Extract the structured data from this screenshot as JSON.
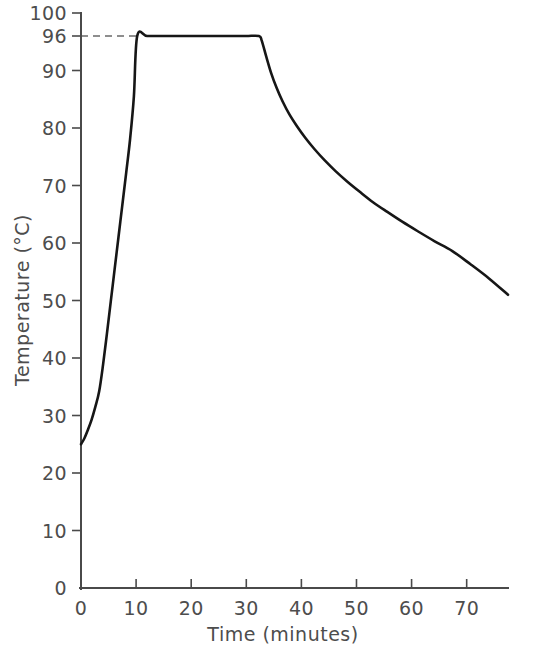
{
  "chart_data": {
    "type": "line",
    "title": "",
    "subtitle": "",
    "xlabel": "Time (minutes)",
    "ylabel": "Temperature (°C)",
    "xlim": [
      0,
      77.5
    ],
    "ylim": [
      0,
      100
    ],
    "grid": false,
    "legend": null,
    "x_ticks": [
      0,
      10,
      20,
      30,
      40,
      50,
      60,
      70
    ],
    "x_tick_labels": [
      "0",
      "10",
      "20",
      "30",
      "40",
      "50",
      "60",
      "70"
    ],
    "y_ticks": [
      0,
      10,
      20,
      30,
      40,
      50,
      60,
      70,
      80,
      90,
      96,
      100
    ],
    "y_tick_labels": [
      "0",
      "10",
      "20",
      "30",
      "40",
      "50",
      "60",
      "70",
      "80",
      "90",
      "96",
      "100"
    ],
    "annotations": [
      {
        "name": "plateau-reference-line",
        "style": "dashed",
        "value": 96,
        "label": "96",
        "from_x": 0,
        "to_x": 10.2,
        "description": "Dashed horizontal reference line marking the 96 °C holding temperature"
      }
    ],
    "series": [
      {
        "name": "Temperature profile",
        "x": [
          0,
          0.6,
          1.2,
          1.9,
          2.6,
          3.3,
          4.0,
          4.7,
          5.4,
          6.1,
          6.8,
          7.5,
          8.2,
          8.9,
          9.6,
          10.2,
          12,
          15,
          18,
          21,
          24,
          27,
          30,
          32.3,
          32.8,
          33.6,
          34.5,
          35.5,
          36.6,
          37.8,
          39.2,
          40.7,
          42.4,
          44.2,
          46.2,
          48.3,
          50.6,
          53.0,
          55.6,
          58.3,
          61.2,
          64.2,
          67.4,
          70.7,
          74.1,
          77.5
        ],
        "y": [
          25.0,
          26.0,
          27.4,
          29.2,
          31.5,
          34.2,
          38.8,
          44.2,
          49.8,
          55.4,
          61.0,
          66.6,
          72.2,
          78.0,
          85.5,
          96.0,
          96.0,
          96.0,
          96.0,
          96.0,
          96.0,
          96.0,
          96.0,
          96.0,
          95.2,
          92.5,
          89.6,
          87.0,
          84.6,
          82.4,
          80.3,
          78.3,
          76.3,
          74.4,
          72.5,
          70.7,
          68.9,
          67.1,
          65.4,
          63.7,
          62.0,
          60.3,
          58.6,
          56.3,
          53.8,
          51.0
        ]
      }
    ],
    "key_values": {
      "initial_temperature": 25,
      "hold_temperature": 96,
      "hold_start_minutes": 10,
      "hold_end_minutes": 32.5,
      "final_temperature": 51,
      "final_time_minutes": 77.5
    },
    "colors": {
      "curve": "#161616",
      "axis": "#4a4a4a",
      "text": "#4d4d4d",
      "dashed_reference": "#6a6a6a",
      "background": "#ffffff"
    }
  }
}
